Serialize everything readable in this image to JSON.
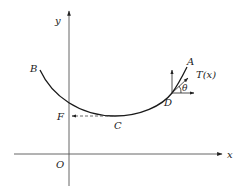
{
  "figure": {
    "type": "catenary-cable-diagram",
    "axes": {
      "x_label": "x",
      "y_label": "y",
      "origin_label": "O"
    },
    "points": {
      "A": "A",
      "B": "B",
      "C": "C",
      "D": "D",
      "F": "F"
    },
    "force_label": "T(x)",
    "angle_label": "θ",
    "colors": {
      "ink": "#1a1a1a",
      "axis": "#555555"
    }
  }
}
